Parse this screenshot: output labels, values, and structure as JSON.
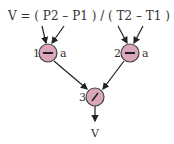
{
  "formula": {
    "text": "V = ( P2 – P1 ) / ( T2 – T1 )"
  },
  "nodes": [
    {
      "id": "1",
      "label": "1",
      "operator": "−",
      "annotation": "a"
    },
    {
      "id": "2",
      "label": "2",
      "operator": "−",
      "annotation": "a"
    },
    {
      "id": "3",
      "label": "3",
      "operator": "/",
      "annotation": ""
    }
  ],
  "output": {
    "label": "V"
  },
  "colors": {
    "node_fill": "#d9a6ba",
    "node_stroke": "#444444",
    "line": "#222222",
    "text": "#333333"
  }
}
